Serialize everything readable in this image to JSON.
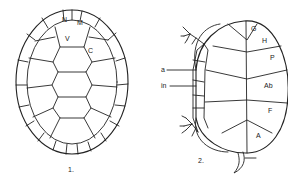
{
  "figure1": {
    "caption": "1.",
    "labels": {
      "nuchal": "N",
      "marginal": "M",
      "vertebral": "V",
      "costal": "C"
    }
  },
  "figure2": {
    "caption": "2.",
    "labels": {
      "gular": "G",
      "humeral": "H",
      "pectoral": "P",
      "abdominal": "Ab",
      "femoral": "F",
      "anal": "A",
      "axillary": "a",
      "inframarginal": "in"
    }
  },
  "colors": {
    "line": "#222222",
    "background": "#ffffff"
  }
}
